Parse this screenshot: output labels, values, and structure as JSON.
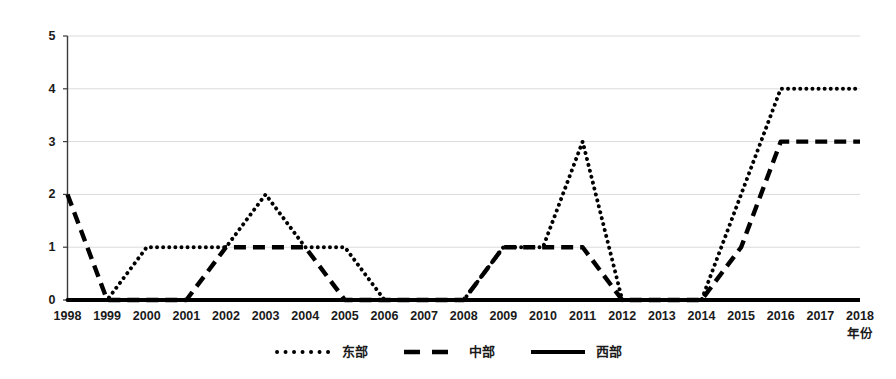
{
  "chart_data": {
    "type": "line",
    "title": "",
    "xlabel": "年份",
    "ylabel": "",
    "xlim": [
      1998,
      2018
    ],
    "ylim": [
      0,
      5
    ],
    "grid": true,
    "legend_position": "bottom",
    "categories": [
      "1998",
      "1999",
      "2000",
      "2001",
      "2002",
      "2003",
      "2004",
      "2005",
      "2006",
      "2007",
      "2008",
      "2009",
      "2010",
      "2011",
      "2012",
      "2013",
      "2014",
      "2015",
      "2016",
      "2017",
      "2018"
    ],
    "yticks": [
      "0",
      "1",
      "2",
      "3",
      "4",
      "5"
    ],
    "series": [
      {
        "name": "东部",
        "style": "dotted",
        "color": "#000000",
        "values": [
          0,
          0,
          1,
          1,
          1,
          2,
          1,
          1,
          0,
          0,
          0,
          1,
          1,
          3,
          0,
          0,
          0,
          2,
          4,
          4,
          4
        ]
      },
      {
        "name": "中部",
        "style": "dashed",
        "color": "#000000",
        "values": [
          2,
          0,
          0,
          0,
          1,
          1,
          1,
          0,
          0,
          0,
          0,
          1,
          1,
          1,
          0,
          0,
          0,
          1,
          3,
          3,
          3
        ]
      },
      {
        "name": "西部",
        "style": "solid",
        "color": "#000000",
        "values": [
          0,
          0,
          0,
          0,
          0,
          0,
          0,
          0,
          0,
          0,
          0,
          0,
          0,
          0,
          0,
          0,
          0,
          0,
          0,
          0,
          0
        ]
      }
    ]
  }
}
